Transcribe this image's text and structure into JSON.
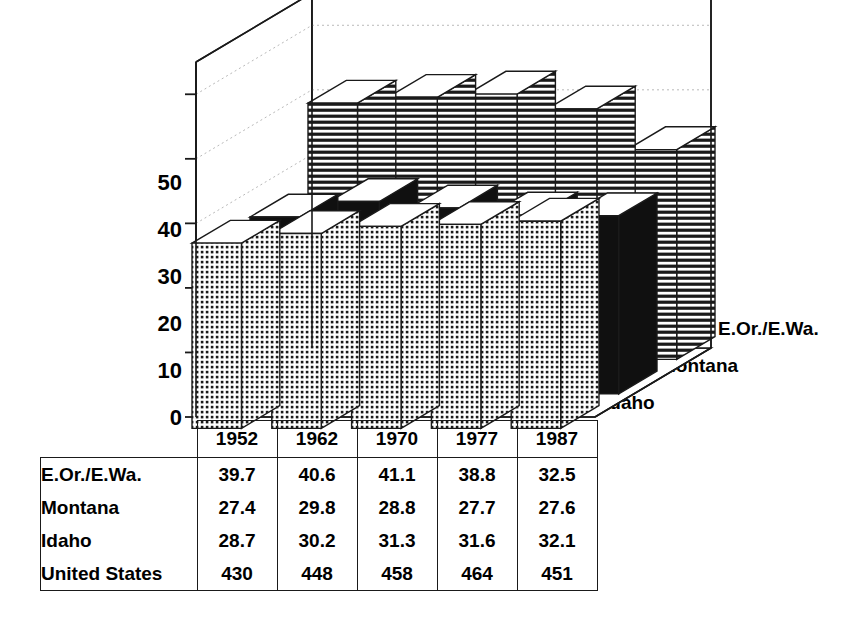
{
  "chart": {
    "title": "Billion cubic feet",
    "y_ticks": [
      "50",
      "40",
      "30",
      "20",
      "10",
      "0"
    ],
    "depth_labels": [
      "E.Or./E.Wa.",
      "Montana",
      "Idaho"
    ]
  },
  "chart_data": {
    "type": "bar",
    "subtype": "3d-grouped-bar",
    "title": "Billion cubic feet",
    "xlabel": "",
    "ylabel": "Billion cubic feet",
    "ylim": [
      0,
      55
    ],
    "ytick_values": [
      0,
      10,
      20,
      30,
      40,
      50
    ],
    "grid": true,
    "legend_position": "right-depth-axis",
    "categories": [
      "1952",
      "1962",
      "1970",
      "1977",
      "1987"
    ],
    "series": [
      {
        "name": "E.Or./E.Wa.",
        "fill": "horizontal-stripes",
        "values": [
          39.7,
          40.6,
          41.1,
          38.8,
          32.5
        ]
      },
      {
        "name": "Montana",
        "fill": "solid-black",
        "values": [
          27.4,
          29.8,
          28.8,
          27.7,
          27.6
        ]
      },
      {
        "name": "Idaho",
        "fill": "dotted-grid",
        "values": [
          28.7,
          30.2,
          31.3,
          31.6,
          32.1
        ]
      }
    ],
    "table_only_series": [
      {
        "name": "United States",
        "values": [
          430,
          448,
          458,
          464,
          451
        ]
      }
    ]
  },
  "table": {
    "header_blank": "",
    "columns": [
      "1952",
      "1962",
      "1970",
      "1977",
      "1987"
    ],
    "rows": [
      {
        "label": "E.Or./E.Wa.",
        "values": [
          "39.7",
          "40.6",
          "41.1",
          "38.8",
          "32.5"
        ]
      },
      {
        "label": "Montana",
        "values": [
          "27.4",
          "29.8",
          "28.8",
          "27.7",
          "27.6"
        ]
      },
      {
        "label": "Idaho",
        "values": [
          "28.7",
          "30.2",
          "31.3",
          "31.6",
          "32.1"
        ]
      },
      {
        "label": "United States",
        "values": [
          "430",
          "448",
          "458",
          "464",
          "451"
        ]
      }
    ]
  },
  "colors": {
    "ink": "#1a1a1a",
    "paper": "#ffffff",
    "solid_fill": "#101010",
    "grid": "#b9b9b9"
  }
}
